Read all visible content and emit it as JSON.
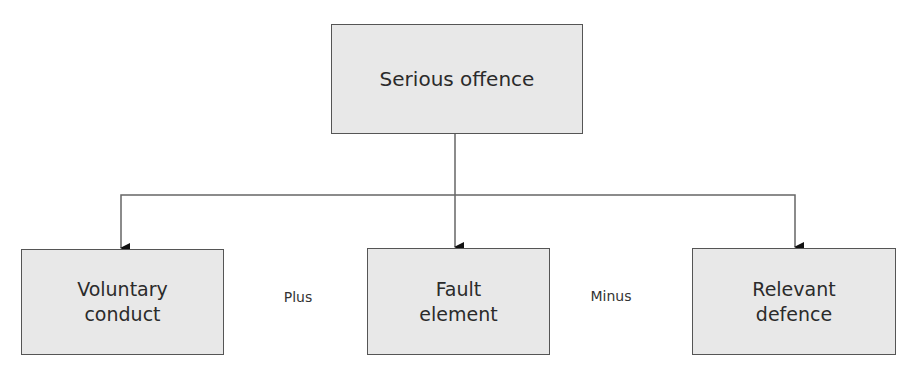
{
  "diagram": {
    "top": {
      "label": "Serious offence"
    },
    "children": [
      {
        "label": "Voluntary\nconduct"
      },
      {
        "label": "Fault\nelement"
      },
      {
        "label": "Relevant\ndefence"
      }
    ],
    "operators": [
      {
        "label": "Plus"
      },
      {
        "label": "Minus"
      }
    ],
    "colors": {
      "box_fill": "#e8e8e8",
      "border": "#555555",
      "line": "#666666"
    }
  }
}
